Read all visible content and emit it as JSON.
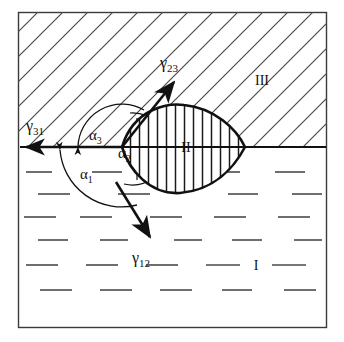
{
  "figure": {
    "type": "schematic-diagram",
    "frame": {
      "x": 18,
      "y": 12,
      "width": 309,
      "height": 316,
      "stroke": "#3a3a3a"
    },
    "colors": {
      "ink": "#111111",
      "frame": "#3a3a3a",
      "hatch_upper": "#4a4a4a",
      "dash_lower": "#4a4a4a",
      "lens_fill_hatch": "#222222"
    }
  },
  "regions": [
    {
      "id": "I",
      "label": "I",
      "name": "region-one-label",
      "x": 256,
      "y": 266,
      "fill_style": "horizontal-dashes",
      "position": "lower half"
    },
    {
      "id": "II",
      "label": "II",
      "name": "region-two-label",
      "x": 186,
      "y": 148,
      "fill_style": "vertical-hatch",
      "position": "lens at interface"
    },
    {
      "id": "III",
      "label": "III",
      "name": "region-three-label",
      "x": 262,
      "y": 80,
      "fill_style": "diagonal-hatch",
      "position": "upper half"
    }
  ],
  "vectors": [
    {
      "id": "gamma31",
      "label": "γ31",
      "sub": "31",
      "base": "γ",
      "name": "gamma-31-vector",
      "label_x": 36,
      "label_y": 126,
      "from": [
        122,
        147
      ],
      "to": [
        22,
        147
      ],
      "direction": "left along interface"
    },
    {
      "id": "gamma23",
      "label": "γ23",
      "sub": "23",
      "base": "γ",
      "name": "gamma-23-vector",
      "label_x": 172,
      "label_y": 63,
      "from": [
        122,
        147
      ],
      "to": [
        176,
        80
      ],
      "direction": "upper right along lens upper arc tangent"
    },
    {
      "id": "gamma12",
      "label": "γ12",
      "sub": "12",
      "base": "γ",
      "name": "gamma-12-vector",
      "label_x": 144,
      "label_y": 258,
      "from": [
        116,
        182
      ],
      "to": [
        152,
        240
      ],
      "direction": "lower right along lens lower arc tangent"
    }
  ],
  "angles": [
    {
      "id": "alpha3",
      "label": "α3",
      "sub": "3",
      "base": "α",
      "name": "alpha-3-angle-label",
      "x": 96,
      "y": 135,
      "between": [
        "gamma31",
        "gamma23"
      ]
    },
    {
      "id": "alpha2",
      "label": "α2",
      "sub": "2",
      "base": "α",
      "name": "alpha-2-angle-label",
      "x": 125,
      "y": 153,
      "between": [
        "gamma23",
        "gamma12"
      ]
    },
    {
      "id": "alpha1",
      "label": "α1",
      "sub": "1",
      "base": "α",
      "name": "alpha-1-angle-label",
      "x": 88,
      "y": 174,
      "between": [
        "gamma12",
        "gamma31"
      ]
    }
  ],
  "geometry": {
    "interface_line": {
      "name": "interface-line",
      "x1": 20,
      "y1": 147,
      "x2": 326,
      "y2": 147
    },
    "lens": {
      "name": "lens-shape",
      "left_cusp": [
        122,
        147
      ],
      "right_cusp": [
        245,
        147
      ],
      "top_apex": [
        184,
        105
      ],
      "bottom_apex": [
        180,
        193
      ],
      "hatch": "vertical",
      "hatch_spacing": 9
    }
  }
}
